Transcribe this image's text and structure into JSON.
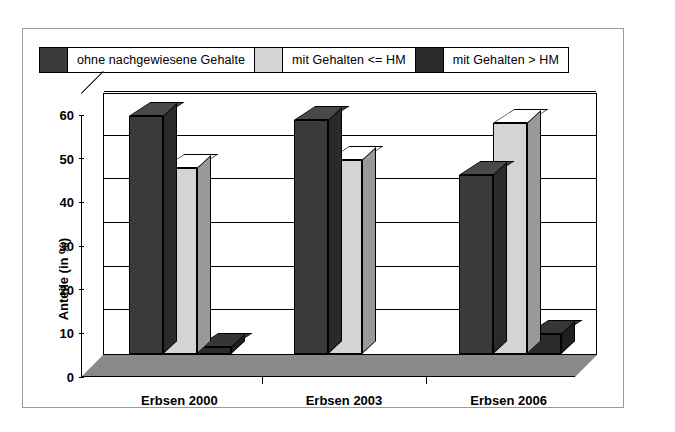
{
  "chart_data": {
    "type": "bar",
    "title": "",
    "xlabel": "",
    "ylabel": "Anteile (in %)",
    "ylim": [
      0,
      60
    ],
    "yticks": [
      0,
      10,
      20,
      30,
      40,
      50,
      60
    ],
    "grid": true,
    "legend_position": "top",
    "style": "3d-clustered-column",
    "categories": [
      "Erbsen 2000",
      "Erbsen 2003",
      "Erbsen 2006"
    ],
    "series": [
      {
        "name": "ohne nachgewiesene Gehalte",
        "color": "#3a3a3a",
        "values": [
          54.5,
          53.5,
          41.0
        ]
      },
      {
        "name": "mit Gehalten <= HM",
        "color": "#d4d4d4",
        "values": [
          42.5,
          44.5,
          53.0
        ]
      },
      {
        "name": "mit Gehalten > HM",
        "color": "#2b2b2b",
        "values": [
          1.5,
          0.0,
          4.5
        ]
      }
    ]
  },
  "legend": {
    "entries": [
      {
        "label": "ohne nachgewiesene Gehalte",
        "swatch": "#3a3a3a"
      },
      {
        "label": "mit Gehalten <= HM",
        "swatch": "#d4d4d4"
      },
      {
        "label": "mit Gehalten > HM",
        "swatch": "#2b2b2b"
      }
    ]
  },
  "axes": {
    "y_title": "Anteile (in %)",
    "y_tick_labels": [
      "0",
      "10",
      "20",
      "30",
      "40",
      "50",
      "60"
    ],
    "x_tick_labels": [
      "Erbsen 2000",
      "Erbsen 2003",
      "Erbsen 2006"
    ]
  },
  "colors": {
    "series_dark": "#3a3a3a",
    "series_light": "#d4d4d4",
    "series_darkest": "#2b2b2b",
    "axis": "#000000",
    "floor": "#8a8a8a",
    "frame": "#9a9a9a",
    "background": "#ffffff"
  }
}
